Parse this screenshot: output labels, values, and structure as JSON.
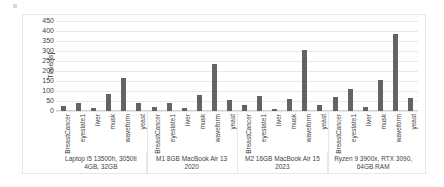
{
  "chart_data": {
    "type": "bar",
    "title": "",
    "xlabel": "",
    "ylabel": "Time [s]",
    "ylim": [
      0,
      450
    ],
    "ytick_step": 50,
    "yticks": [
      450,
      400,
      350,
      300,
      250,
      200,
      150,
      100,
      50,
      0
    ],
    "grid": true,
    "legend": "none",
    "categories": [
      "BreastCancer",
      "eyestate1",
      "liver",
      "musk",
      "waveform",
      "yeast"
    ],
    "groups": [
      {
        "name": "Laptop i5 13500h, 3050ti 4GB, 32GB",
        "values": [
          22,
          37,
          12,
          85,
          162,
          40
        ]
      },
      {
        "name": "M1 8GB MacBook Air 13 2020",
        "values": [
          20,
          38,
          12,
          80,
          232,
          55
        ]
      },
      {
        "name": "M2 16GB MacBook Air 15 2023",
        "values": [
          28,
          75,
          7,
          60,
          303,
          28
        ]
      },
      {
        "name": "Ryzen 9 3900x, RTX 3090, 64GB RAM",
        "values": [
          68,
          108,
          18,
          153,
          382,
          62
        ]
      }
    ],
    "bar_color": "#636363",
    "grid_color": "#e9e9e9",
    "text_color": "#3f3f3f"
  }
}
